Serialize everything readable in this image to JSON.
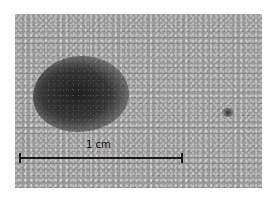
{
  "image": {
    "description": "Grayscale close-up photograph of skin showing a dark pigmented lesion with a small dark spot to the right",
    "scale_bar": {
      "label": "1 cm",
      "color": "#1a1a1a"
    },
    "colors": {
      "background": "#ffffff",
      "skin": "#9a9a9a",
      "lesion": "#222222"
    }
  }
}
